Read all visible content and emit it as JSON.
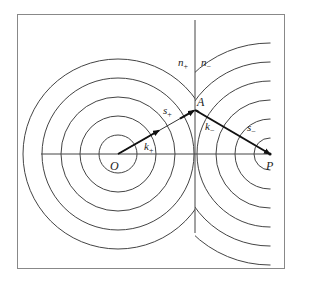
{
  "diagram": {
    "labels": {
      "n_plus": "n",
      "n_plus_sub": "+",
      "n_minus": "n",
      "n_minus_sub": "−",
      "A": "A",
      "O": "O",
      "P": "P",
      "s_plus": "s",
      "s_plus_sub": "+",
      "s_minus": "s",
      "s_minus_sub": "−",
      "k_plus": "k",
      "k_plus_sub": "+",
      "k_minus": "k",
      "k_minus_sub": "−"
    },
    "colors": {
      "line": "#444444",
      "arrow": "#111111",
      "frame": "#777777"
    }
  }
}
